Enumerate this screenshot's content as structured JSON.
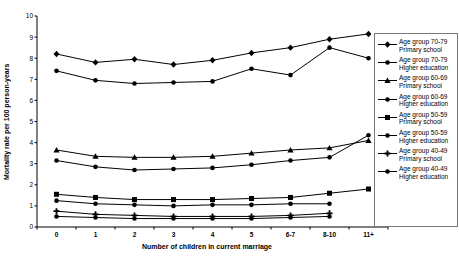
{
  "figure": {
    "background": "#ffffff",
    "line_color": "#000000",
    "legend_border_color": "#7a7a7a"
  },
  "chart_data": {
    "type": "line",
    "title": "",
    "xlabel": "Number of children in current marriage",
    "ylabel": "Mortality rate per 100 person-years",
    "categories": [
      "0",
      "1",
      "2",
      "3",
      "4",
      "5",
      "6-7",
      "8-10",
      "11+"
    ],
    "ylim": [
      0,
      10
    ],
    "yticks": [
      0,
      1,
      2,
      3,
      4,
      5,
      6,
      7,
      8,
      9,
      10
    ],
    "grid": false,
    "legend_position": "right",
    "series": [
      {
        "name": "Age group 70-79 Primary school",
        "label_lines": [
          "Age group 70-79",
          "Primary school"
        ],
        "marker": "diamond",
        "values": [
          8.2,
          7.8,
          7.95,
          7.7,
          7.9,
          8.25,
          8.5,
          8.9,
          9.15
        ]
      },
      {
        "name": "Age group 70-79 Higher education",
        "label_lines": [
          "Age group 70-79",
          "Higher education"
        ],
        "marker": "circle",
        "values": [
          7.4,
          6.95,
          6.8,
          6.85,
          6.9,
          7.5,
          7.2,
          8.5,
          8.0
        ]
      },
      {
        "name": "Age group 60-69 Primary school",
        "label_lines": [
          "Age group 60-69",
          "Primary school"
        ],
        "marker": "triangle",
        "values": [
          3.65,
          3.35,
          3.3,
          3.3,
          3.35,
          3.5,
          3.65,
          3.75,
          4.1
        ]
      },
      {
        "name": "Age group 60-69 Higher education",
        "label_lines": [
          "Age group 60-69",
          "Higher education"
        ],
        "marker": "circle",
        "values": [
          3.15,
          2.85,
          2.7,
          2.75,
          2.8,
          2.95,
          3.15,
          3.3,
          4.35
        ]
      },
      {
        "name": "Age group 50-59 Primary school",
        "label_lines": [
          "Age group 50-59",
          "Primary school"
        ],
        "marker": "square",
        "values": [
          1.55,
          1.4,
          1.3,
          1.3,
          1.3,
          1.35,
          1.4,
          1.6,
          1.8
        ]
      },
      {
        "name": "Age group 50-59 Higher education",
        "label_lines": [
          "Age group 50-59",
          "Higher education"
        ],
        "marker": "circle",
        "values": [
          1.25,
          1.1,
          1.05,
          1.0,
          1.05,
          1.05,
          1.1,
          1.1,
          null
        ]
      },
      {
        "name": "Age group 40-49 Primary school",
        "label_lines": [
          "Age group 40-49",
          "Primary school"
        ],
        "marker": "plus",
        "values": [
          0.75,
          0.6,
          0.55,
          0.5,
          0.5,
          0.5,
          0.55,
          0.65,
          null
        ]
      },
      {
        "name": "Age group 40-49 Higher education",
        "label_lines": [
          "Age group 40-49",
          "Higher education"
        ],
        "marker": "circle",
        "values": [
          0.5,
          0.45,
          0.4,
          0.4,
          0.4,
          0.4,
          0.45,
          0.5,
          null
        ]
      }
    ]
  }
}
